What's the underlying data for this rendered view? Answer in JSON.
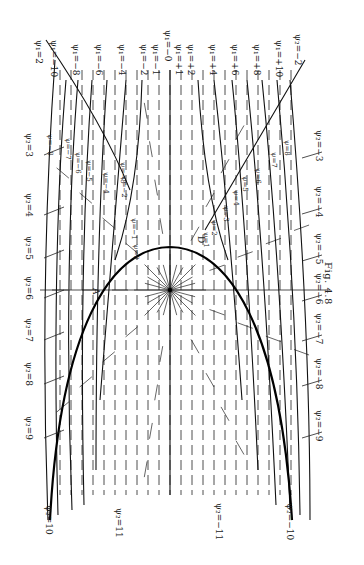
{
  "figure": {
    "caption": "Fig. 4.8",
    "orientation": "rotated 90° clockwise",
    "background": "#ffffff",
    "ink": "#1a1a1a"
  },
  "labels": {
    "top": [
      {
        "text": "ψ₁=2",
        "x": 44,
        "y": 40
      },
      {
        "text": "ψ₁=−10",
        "x": 59,
        "y": 40
      },
      {
        "text": "ψ₁=−8",
        "x": 81,
        "y": 44
      },
      {
        "text": "ψ₁=−6",
        "x": 104,
        "y": 44
      },
      {
        "text": "ψ₁=−4",
        "x": 127,
        "y": 44
      },
      {
        "text": "ψ₁=−2",
        "x": 149,
        "y": 44
      },
      {
        "text": "ψ₁=−1",
        "x": 161,
        "y": 44
      },
      {
        "text": "ψ₁=−0",
        "x": 173,
        "y": 30
      },
      {
        "text": "ψ₁=+1",
        "x": 184,
        "y": 44
      },
      {
        "text": "ψ₁=+2",
        "x": 196,
        "y": 44
      },
      {
        "text": "ψ₁=+4",
        "x": 218,
        "y": 44
      },
      {
        "text": "ψ₁=+6",
        "x": 240,
        "y": 44
      },
      {
        "text": "ψ₁=+8",
        "x": 262,
        "y": 44
      },
      {
        "text": "ψ₁=+10",
        "x": 284,
        "y": 40
      },
      {
        "text": "ψ₂=−2",
        "x": 303,
        "y": 34
      }
    ],
    "left": [
      {
        "text": "ψ₂=3",
        "x": 34,
        "y": 133
      },
      {
        "text": "ψ₂=4",
        "x": 34,
        "y": 193
      },
      {
        "text": "ψ₂=5",
        "x": 34,
        "y": 236
      },
      {
        "text": "ψ₂=6",
        "x": 34,
        "y": 276
      },
      {
        "text": "ψ₂=7",
        "x": 34,
        "y": 318
      },
      {
        "text": "ψ₂=8",
        "x": 34,
        "y": 362
      },
      {
        "text": "ψ₂=9",
        "x": 34,
        "y": 416
      },
      {
        "text": "ψ₂=10",
        "x": 54,
        "y": 505
      },
      {
        "text": "ψ₂=11",
        "x": 124,
        "y": 508
      }
    ],
    "right": [
      {
        "text": "ψ₂=−3",
        "x": 324,
        "y": 130
      },
      {
        "text": "ψ₂=−4",
        "x": 324,
        "y": 186
      },
      {
        "text": "ψ₂=−5",
        "x": 324,
        "y": 233
      },
      {
        "text": "ψ₂=−6",
        "x": 324,
        "y": 273
      },
      {
        "text": "ψ₂=−7",
        "x": 324,
        "y": 313
      },
      {
        "text": "ψ₂=−8",
        "x": 324,
        "y": 358
      },
      {
        "text": "ψ₂=−9",
        "x": 324,
        "y": 410
      },
      {
        "text": "ψ₂=−10",
        "x": 295,
        "y": 503
      },
      {
        "text": "ψ₂=−11",
        "x": 224,
        "y": 503
      }
    ],
    "inner_left": [
      {
        "text": "ψ=−8",
        "x": 54,
        "y": 134
      },
      {
        "text": "ψ=−7",
        "x": 72,
        "y": 138
      },
      {
        "text": "ψ=−6",
        "x": 82,
        "y": 152
      },
      {
        "text": "ψ=−5",
        "x": 93,
        "y": 160
      },
      {
        "text": "ψ=−4",
        "x": 110,
        "y": 172
      },
      {
        "text": "ψ=−3",
        "x": 127,
        "y": 162
      },
      {
        "text": "ψ=−2",
        "x": 128,
        "y": 176
      },
      {
        "text": "ψ=−1",
        "x": 138,
        "y": 218
      },
      {
        "text": "ψ=0",
        "x": 140,
        "y": 244
      }
    ],
    "inner_right": [
      {
        "text": "ψ=8",
        "x": 291,
        "y": 140
      },
      {
        "text": "ψ=7",
        "x": 278,
        "y": 152
      },
      {
        "text": "ψ=6",
        "x": 262,
        "y": 168
      },
      {
        "text": "ψ=5",
        "x": 249,
        "y": 176
      },
      {
        "text": "ψ=4",
        "x": 240,
        "y": 190
      },
      {
        "text": "ψ=3",
        "x": 230,
        "y": 206
      },
      {
        "text": "ψ=2",
        "x": 218,
        "y": 220
      },
      {
        "text": "ψ=1",
        "x": 210,
        "y": 232
      }
    ],
    "points": [
      {
        "text": "A",
        "x": 101,
        "y": 288
      },
      {
        "text": "D",
        "x": 206,
        "y": 236
      }
    ],
    "caption_pos": {
      "x": 334,
      "y": 262
    }
  },
  "geometry": {
    "source": {
      "x": 170,
      "y": 290
    },
    "psi0_curve": "M 50 520 C 60 330, 110 248, 170 247 C 230 248, 280 330, 292 520",
    "left_streamlines": [
      "M 46 40 C 80 90, 110 140, 130 190",
      "M 55 60 C 45 200, 42 360, 48 520",
      "M 66 80 C 56 200, 54 360, 58 515",
      "M 78 80 C 68 200, 66 360, 72 510",
      "M 92 80 C 84 190, 80 330, 84 505",
      "M 107 80 C 100 180, 96 300, 96 470",
      "M 126 80 C 118 170, 112 260, 100 400",
      "M 142 80 C 140 150, 132 210, 115 260"
    ],
    "right_streamlines": [
      "M 305 60 C 270 120, 240 170, 205 230",
      "M 290 80 C 300 200, 310 360, 310 520",
      "M 277 80 C 288 200, 298 360, 300 515",
      "M 262 80 C 274 200, 284 360, 290 510",
      "M 247 80 C 258 190, 268 330, 276 505",
      "M 232 80 C 242 180, 250 300, 258 470",
      "M 214 80 C 224 170, 232 260, 242 400",
      "M 198 80 C 202 150, 210 210, 228 260"
    ],
    "horizontal_axis": {
      "y": 290,
      "x1": 40,
      "x2": 330
    },
    "vertical_axis": {
      "x": 170,
      "y1": 70,
      "y2": 495
    }
  }
}
